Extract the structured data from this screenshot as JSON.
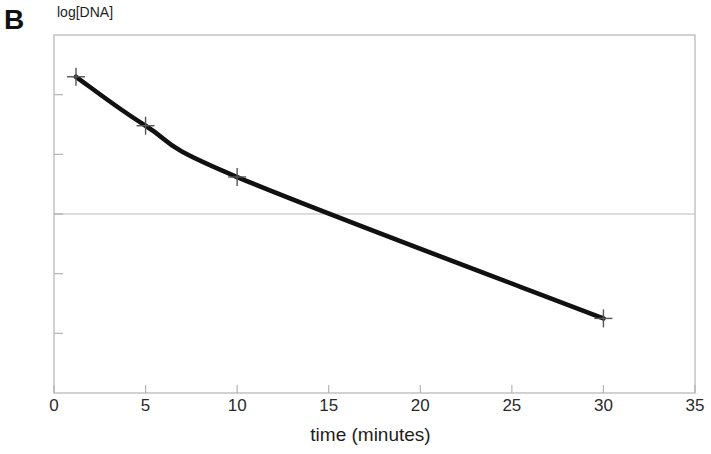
{
  "figure": {
    "panel_label": "B",
    "background_color": "#ffffff",
    "frame_color": "#b3b3b3",
    "line_color": "#111111",
    "marker_color": "#555555",
    "gridline_color": "#bbbbbb"
  },
  "chart_data": {
    "type": "line",
    "title": "",
    "xlabel": "time (minutes)",
    "ylabel": "log[DNA]",
    "xlim": [
      0,
      35
    ],
    "ylim": [
      0,
      6
    ],
    "xticks": [
      0,
      5,
      10,
      15,
      20,
      25,
      30,
      35
    ],
    "xticklabels": [
      "0",
      "5",
      "10",
      "15",
      "20",
      "25",
      "30",
      "35"
    ],
    "yticks": [
      1,
      2,
      3,
      4,
      5
    ],
    "yticklabels": [
      "",
      "",
      "",
      "",
      ""
    ],
    "grid": "one horizontal gridline at y=3",
    "gridlines_y": [
      3
    ],
    "legend": "none",
    "series": [
      {
        "name": "log[DNA]",
        "marker": "plus",
        "x": [
          1.2,
          5,
          10,
          30
        ],
        "y": [
          5.3,
          4.48,
          3.62,
          1.25
        ]
      }
    ]
  }
}
